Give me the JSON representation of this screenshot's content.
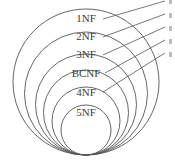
{
  "diagram": {
    "colors": {
      "stroke": "#555555",
      "text": "#3a3a3a",
      "background": "#ffffff"
    },
    "tangent_point": {
      "x": 86,
      "y": 155
    },
    "levels": [
      {
        "label": "1NF",
        "radius": 73,
        "label_y": 22
      },
      {
        "label": "2NF",
        "radius": 61.5,
        "label_y": 40
      },
      {
        "label": "3NF",
        "radius": 50.5,
        "label_y": 58
      },
      {
        "label": "BCNF",
        "radius": 42.5,
        "label_y": 77
      },
      {
        "label": "4NF",
        "radius": 34,
        "label_y": 96
      },
      {
        "label": "5NF",
        "radius": 25,
        "label_y": 116
      }
    ],
    "leaders": [
      {
        "x1": 103,
        "y1": 19,
        "x2": 165,
        "y2": 1
      },
      {
        "x1": 103,
        "y1": 37,
        "x2": 165,
        "y2": 14
      },
      {
        "x1": 103,
        "y1": 55,
        "x2": 165,
        "y2": 27
      },
      {
        "x1": 105,
        "y1": 73,
        "x2": 165,
        "y2": 40
      },
      {
        "x1": 103,
        "y1": 92,
        "x2": 165,
        "y2": 53
      }
    ]
  }
}
